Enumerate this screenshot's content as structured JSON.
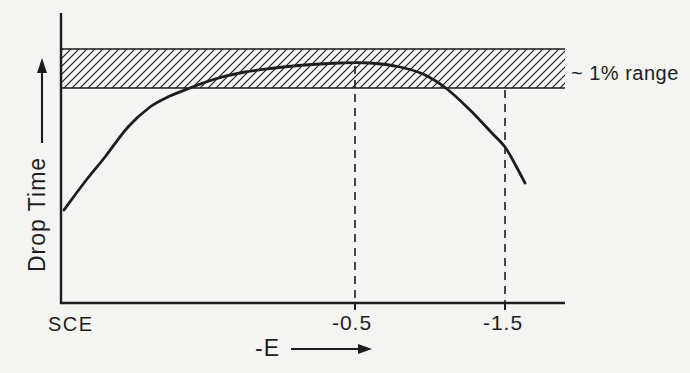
{
  "colors": {
    "background": "#f4f4f2",
    "ink": "#1d1d1d"
  },
  "chart_data": {
    "type": "line",
    "title": "",
    "xlabel": "-E",
    "ylabel": "Drop Time",
    "x_origin_label": "SCE",
    "x_ticks": [
      {
        "value": -0.5,
        "label": "-0.5"
      },
      {
        "value": -1.5,
        "label": "-1.5"
      }
    ],
    "band": {
      "label": "~ 1% range",
      "meaning": "hatched band: region within about 1% of the maximum drop time",
      "relative_drop_time_range": [
        0.9,
        1.06
      ]
    },
    "axes": {
      "x_units": "V vs SCE (negative potential increasing to the right)",
      "y_units": "drop time (unlabeled, relative)",
      "grid": false,
      "note": "schematic figure; x spacing is not linear"
    },
    "series": [
      {
        "name": "drop-time-curve",
        "points_E_vs_relative_drop_time": [
          [
            0.0,
            0.39
          ],
          [
            -0.04,
            0.5
          ],
          [
            -0.07,
            0.61
          ],
          [
            -0.11,
            0.73
          ],
          [
            -0.15,
            0.82
          ],
          [
            -0.18,
            0.86
          ],
          [
            -0.22,
            0.9
          ],
          [
            -0.26,
            0.93
          ],
          [
            -0.31,
            0.96
          ],
          [
            -0.36,
            0.98
          ],
          [
            -0.41,
            0.99
          ],
          [
            -0.47,
            1.0
          ],
          [
            -0.59,
            1.0
          ],
          [
            -0.8,
            0.98
          ],
          [
            -0.96,
            0.95
          ],
          [
            -1.11,
            0.89
          ],
          [
            -1.27,
            0.8
          ],
          [
            -1.4,
            0.72
          ],
          [
            -1.5,
            0.65
          ],
          [
            -1.57,
            0.57
          ],
          [
            -1.63,
            0.5
          ]
        ]
      }
    ],
    "dashed_guides_at_E": [
      -0.5,
      -1.5
    ]
  },
  "geometry": {
    "canvas": {
      "w": 690,
      "h": 373
    },
    "axis": {
      "x0": 61,
      "y_top": 13,
      "y_bottom": 303,
      "x_right": 565,
      "stroke_w": 2.4
    },
    "band": {
      "x1": 61,
      "x2": 565,
      "y1": 49,
      "y2": 88,
      "border_w": 1.5,
      "hatch_spacing": 8,
      "hatch_w": 1.2
    },
    "curve_px": [
      [
        64,
        210
      ],
      [
        84,
        183
      ],
      [
        105,
        157
      ],
      [
        128,
        127
      ],
      [
        150,
        107
      ],
      [
        170,
        96
      ],
      [
        190,
        88
      ],
      [
        215,
        79
      ],
      [
        245,
        72
      ],
      [
        275,
        68
      ],
      [
        305,
        65
      ],
      [
        340,
        63
      ],
      [
        370,
        63
      ],
      [
        400,
        67
      ],
      [
        425,
        75
      ],
      [
        447,
        89
      ],
      [
        470,
        110
      ],
      [
        490,
        131
      ],
      [
        505,
        147
      ],
      [
        516,
        166
      ],
      [
        525,
        183
      ]
    ],
    "curve_w": 2.8,
    "dashed": [
      {
        "x": 355,
        "y1": 66,
        "y2": 303
      },
      {
        "x": 505,
        "y1": 90,
        "y2": 303
      }
    ],
    "dash_pattern": "8 6",
    "dash_w": 1.6,
    "tick_len": 7,
    "tick_w": 2,
    "labels": [
      {
        "name": "x-axis-origin-label",
        "bind": "chart_data.x_origin_label",
        "x": 48,
        "y": 331,
        "anchor": "start",
        "size": 20,
        "ls": 1.5
      },
      {
        "name": "x-tick-label-neg-0-5",
        "bind": "chart_data.x_ticks.0.label",
        "x": 352,
        "y": 330,
        "anchor": "middle",
        "size": 21,
        "ls": 1
      },
      {
        "name": "x-tick-label-neg-1-5",
        "bind": "chart_data.x_ticks.1.label",
        "x": 503,
        "y": 330,
        "anchor": "middle",
        "size": 21,
        "ls": 1
      },
      {
        "name": "band-range-label",
        "bind": "chart_data.band.label",
        "x": 571,
        "y": 80,
        "anchor": "start",
        "size": 20,
        "ls": 0.5
      },
      {
        "name": "x-axis-label",
        "bind": "chart_data.xlabel",
        "x": 255,
        "y": 356,
        "anchor": "start",
        "size": 23,
        "ls": 1
      }
    ],
    "ylabel": {
      "bind": "chart_data.ylabel",
      "tx": 45,
      "ty": 272,
      "size": 23,
      "ls": 1
    },
    "arrows": [
      {
        "name": "y-axis-direction-arrow",
        "orient": "up",
        "x": 42,
        "shaft_from": 143,
        "shaft_to": 72,
        "tip": 58,
        "head_len": 15,
        "half_w": 5,
        "w": 2.1
      },
      {
        "name": "x-axis-direction-arrow",
        "orient": "right",
        "y": 349,
        "shaft_from": 291,
        "shaft_to": 359,
        "tip": 372,
        "head_len": 14,
        "half_w": 5,
        "w": 2.1
      }
    ]
  }
}
